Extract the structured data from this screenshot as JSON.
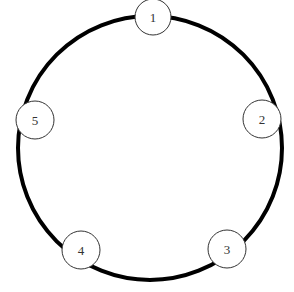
{
  "diagram": {
    "type": "cycle-graph",
    "ring": {
      "cx": 150,
      "cy": 148,
      "r": 132,
      "stroke": "#000000",
      "stroke_width": 4
    },
    "nodes": [
      {
        "id": "1",
        "label": "1",
        "cx": 153,
        "cy": 17,
        "r": 18
      },
      {
        "id": "2",
        "label": "2",
        "cx": 262,
        "cy": 119,
        "r": 19
      },
      {
        "id": "3",
        "label": "3",
        "cx": 227,
        "cy": 249,
        "r": 19
      },
      {
        "id": "4",
        "label": "4",
        "cx": 81,
        "cy": 250,
        "r": 19
      },
      {
        "id": "5",
        "label": "5",
        "cx": 35,
        "cy": 120,
        "r": 19
      }
    ]
  }
}
